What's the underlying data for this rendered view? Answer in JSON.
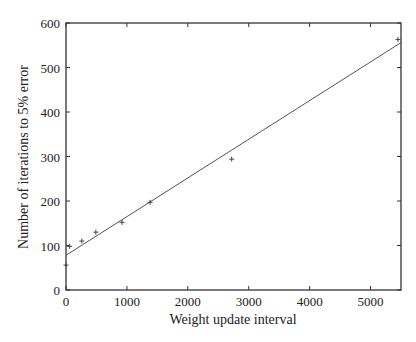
{
  "chart_data": {
    "type": "scatter",
    "title": "",
    "xlabel": "Weight update interval",
    "ylabel": "Number of iterations to 5% error",
    "xlim": [
      0,
      5500
    ],
    "ylim": [
      0,
      600
    ],
    "xticks": [
      0,
      1000,
      2000,
      3000,
      4000,
      5000
    ],
    "yticks": [
      0,
      100,
      200,
      300,
      400,
      500,
      600
    ],
    "grid": false,
    "legend": null,
    "series": [
      {
        "name": "measured",
        "marker": "+",
        "points": [
          {
            "x": 0,
            "y": 56
          },
          {
            "x": 60,
            "y": 98
          },
          {
            "x": 260,
            "y": 110
          },
          {
            "x": 490,
            "y": 130
          },
          {
            "x": 920,
            "y": 152
          },
          {
            "x": 1380,
            "y": 197
          },
          {
            "x": 2720,
            "y": 294
          },
          {
            "x": 5450,
            "y": 563
          }
        ]
      },
      {
        "name": "linear fit",
        "type": "line",
        "points": [
          {
            "x": 0,
            "y": 78
          },
          {
            "x": 5500,
            "y": 556
          }
        ]
      }
    ]
  },
  "labels": {
    "xlabel": "Weight update interval",
    "ylabel": "Number of iterations to 5% error"
  }
}
